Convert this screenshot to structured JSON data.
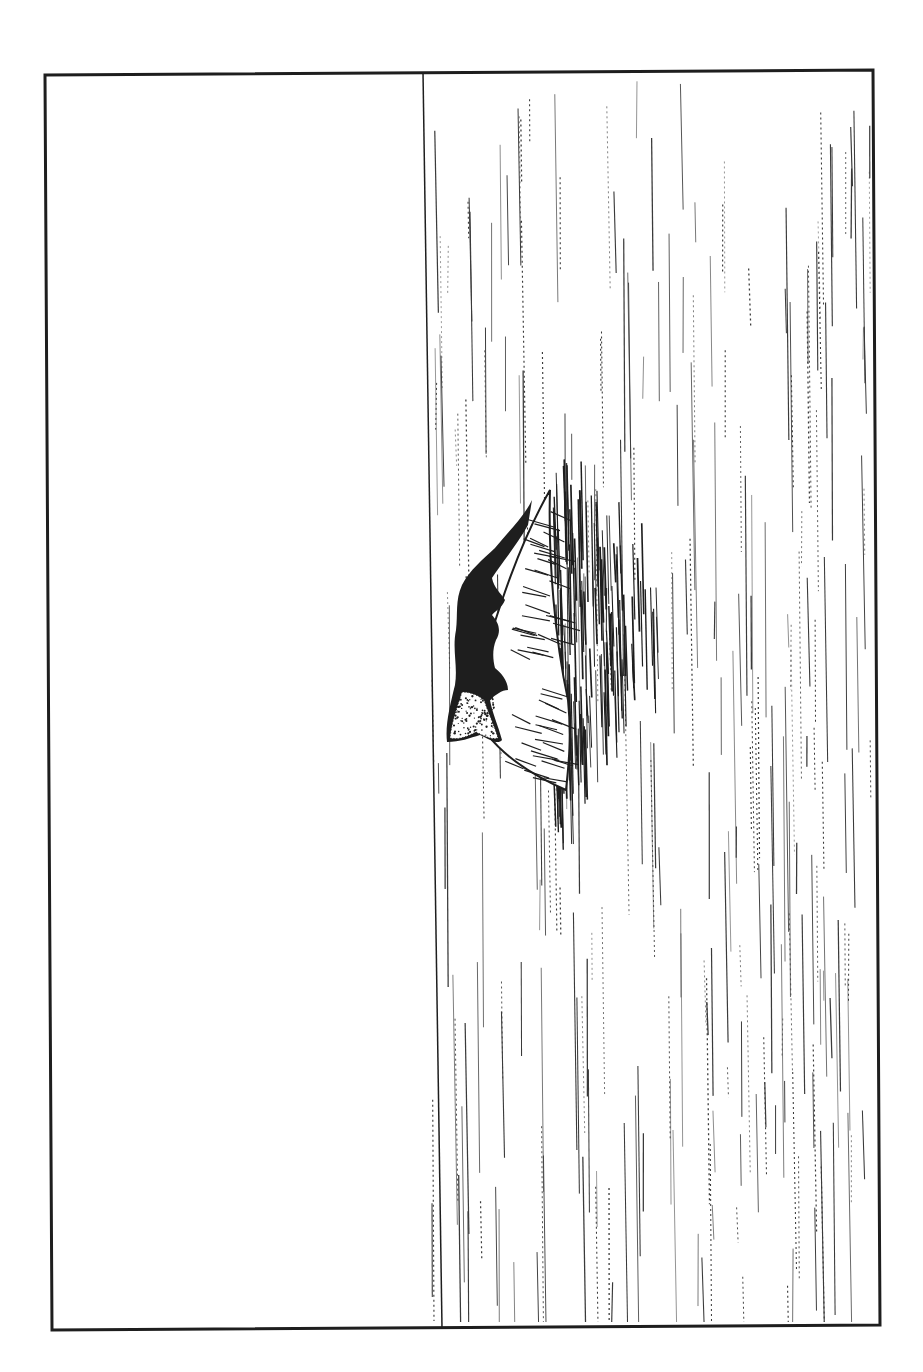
{
  "illustration": {
    "subject": "crocodile resting on a sandbank in water",
    "style": "black pen-and-ink line drawing, rotated 90 degrees",
    "colors": {
      "ink": "#1e1e1e",
      "paper": "#ffffff",
      "hatch": "#3a3a3a"
    },
    "frame": {
      "tl": [
        45,
        75
      ],
      "tr": [
        873,
        70
      ],
      "br": [
        880,
        1325
      ],
      "bl": [
        52,
        1330
      ],
      "stroke_width": 3
    },
    "horizon": {
      "x1": 423,
      "y1": 72,
      "x2": 442,
      "y2": 1328
    },
    "sky_region": "blank area left of horizon",
    "water_region": "vertical hatching right of horizon"
  }
}
